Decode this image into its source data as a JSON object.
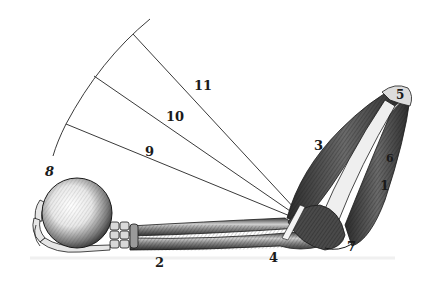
{
  "figure": {
    "background": "#ffffff",
    "ink": "#1a1a1a",
    "labels": [
      {
        "id": "1",
        "text": "1",
        "x": 380,
        "y": 190
      },
      {
        "id": "2",
        "text": "2",
        "x": 155,
        "y": 267
      },
      {
        "id": "3",
        "text": "3",
        "x": 314,
        "y": 150
      },
      {
        "id": "4",
        "text": "4",
        "x": 269,
        "y": 262
      },
      {
        "id": "5",
        "text": "5",
        "x": 396,
        "y": 99
      },
      {
        "id": "6",
        "text": "6",
        "x": 386,
        "y": 162
      },
      {
        "id": "7",
        "text": "7",
        "x": 347,
        "y": 251
      },
      {
        "id": "8",
        "text": "8",
        "x": 45,
        "y": 176
      },
      {
        "id": "9",
        "text": "9",
        "x": 145,
        "y": 156
      },
      {
        "id": "10",
        "text": "10",
        "x": 166,
        "y": 121
      },
      {
        "id": "11",
        "text": "11",
        "x": 194,
        "y": 90
      }
    ]
  }
}
